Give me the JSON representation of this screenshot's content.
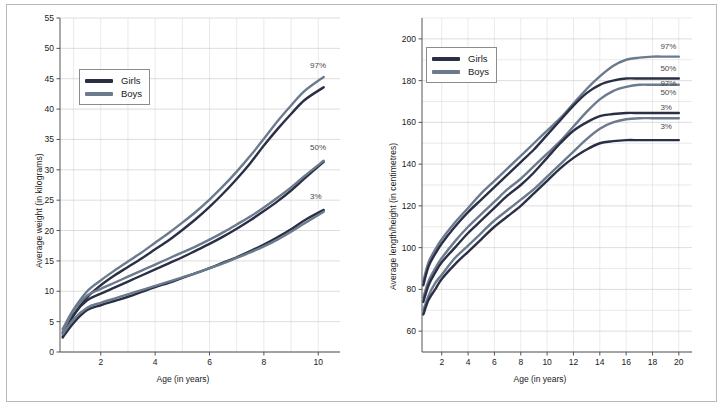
{
  "page": {
    "background": "#ffffff",
    "frame_color": "#b9b9b9"
  },
  "colors": {
    "girls": "#2a2f45",
    "boys": "#6b7a8c",
    "grid_minor": "#dcdcdc",
    "grid_major": "#cfcfcf",
    "axis": "#555555",
    "text": "#1a1a1a",
    "pct_text": "#4a4a4a"
  },
  "legend": {
    "girls_label": "Girls",
    "boys_label": "Boys"
  },
  "chart_data": [
    {
      "id": "weight-chart",
      "type": "line",
      "title": "",
      "xlabel": "Age (in years)",
      "ylabel": "Average weight (in kilograms)",
      "xlim": [
        0.5,
        10.8
      ],
      "ylim": [
        0,
        55
      ],
      "xticks": [
        2,
        4,
        6,
        8,
        10
      ],
      "xticklabels": [
        "2",
        "4",
        "6",
        "8",
        "10"
      ],
      "x_minor_step": 1,
      "yticks": [
        0,
        5,
        10,
        15,
        20,
        25,
        30,
        35,
        40,
        45,
        50,
        55
      ],
      "yticklabels": [
        "0",
        "5",
        "10",
        "15",
        "20",
        "25",
        "30",
        "35",
        "40",
        "45",
        "50",
        "55"
      ],
      "grid": true,
      "legend_position": "upper-left-inside",
      "annotations": [
        {
          "text": "97%",
          "x": 9.7,
          "y": 46.8
        },
        {
          "text": "50%",
          "x": 9.7,
          "y": 33.2
        },
        {
          "text": "3%",
          "x": 9.7,
          "y": 25.2
        }
      ],
      "x": [
        0.6,
        1,
        1.5,
        2,
        2.5,
        3,
        3.5,
        4,
        4.5,
        5,
        5.5,
        6,
        6.5,
        7,
        7.5,
        8,
        8.5,
        9,
        9.5,
        10.2
      ],
      "series": [
        {
          "name": "Girls 97%",
          "sex": "Girls",
          "percentile": "97%",
          "color": "#2a2f45",
          "values": [
            2.6,
            6.0,
            9.0,
            11.0,
            12.6,
            14.0,
            15.4,
            16.9,
            18.4,
            20.1,
            21.9,
            23.9,
            26.1,
            28.5,
            31.1,
            34.0,
            36.7,
            39.2,
            41.5,
            43.6
          ]
        },
        {
          "name": "Boys 97%",
          "sex": "Boys",
          "percentile": "97%",
          "color": "#6b7a8c",
          "values": [
            3.8,
            7.0,
            10.0,
            11.8,
            13.4,
            14.9,
            16.4,
            18.0,
            19.6,
            21.3,
            23.1,
            25.1,
            27.3,
            29.7,
            32.3,
            35.1,
            38.0,
            40.6,
            43.0,
            45.3
          ]
        },
        {
          "name": "Girls 50%",
          "sex": "Girls",
          "percentile": "50%",
          "color": "#2a2f45",
          "values": [
            3.1,
            6.2,
            8.5,
            9.6,
            10.6,
            11.6,
            12.6,
            13.6,
            14.6,
            15.6,
            16.7,
            17.8,
            19.0,
            20.3,
            21.7,
            23.2,
            24.8,
            26.6,
            28.6,
            31.3
          ]
        },
        {
          "name": "Boys 50%",
          "sex": "Boys",
          "percentile": "50%",
          "color": "#6b7a8c",
          "values": [
            3.4,
            6.8,
            9.3,
            10.4,
            11.4,
            12.4,
            13.4,
            14.4,
            15.4,
            16.4,
            17.4,
            18.5,
            19.7,
            21.0,
            22.3,
            23.8,
            25.4,
            27.1,
            29.0,
            31.5
          ]
        },
        {
          "name": "Girls 3%",
          "sex": "Girls",
          "percentile": "3%",
          "color": "#2a2f45",
          "values": [
            2.4,
            4.8,
            6.9,
            7.7,
            8.4,
            9.1,
            9.9,
            10.7,
            11.4,
            12.2,
            13.0,
            13.8,
            14.7,
            15.6,
            16.6,
            17.7,
            18.9,
            20.2,
            21.7,
            23.4
          ]
        },
        {
          "name": "Boys 3%",
          "sex": "Boys",
          "percentile": "3%",
          "color": "#6b7a8c",
          "values": [
            2.9,
            5.4,
            7.3,
            8.1,
            8.8,
            9.5,
            10.2,
            10.9,
            11.6,
            12.3,
            13.0,
            13.8,
            14.6,
            15.5,
            16.4,
            17.4,
            18.5,
            19.8,
            21.2,
            23.1
          ]
        }
      ]
    },
    {
      "id": "height-chart",
      "type": "line",
      "title": "",
      "xlabel": "Age (in years)",
      "ylabel": "Average length/height (in centimetres)",
      "xlim": [
        0.5,
        21
      ],
      "ylim": [
        50,
        210
      ],
      "xticks": [
        2,
        4,
        6,
        8,
        10,
        12,
        14,
        16,
        18,
        20
      ],
      "xticklabels": [
        "2",
        "4",
        "6",
        "8",
        "10",
        "12",
        "14",
        "16",
        "18",
        "20"
      ],
      "x_minor_step": 2,
      "yticks": [
        60,
        80,
        100,
        120,
        140,
        160,
        180,
        200
      ],
      "yticklabels": [
        "60",
        "80",
        "100",
        "120",
        "140",
        "160",
        "180",
        "200"
      ],
      "y_minor_step": 10,
      "grid": true,
      "legend_position": "upper-left-inside",
      "annotations": [
        {
          "text": "97%",
          "x": 18.6,
          "y": 195.0
        },
        {
          "text": "50%",
          "x": 18.6,
          "y": 184.5
        },
        {
          "text": "97%",
          "x": 18.6,
          "y": 177.5
        },
        {
          "text": "50%",
          "x": 18.6,
          "y": 173.0
        },
        {
          "text": "3%",
          "x": 18.6,
          "y": 166.0
        },
        {
          "text": "3%",
          "x": 18.6,
          "y": 157.0
        }
      ],
      "x": [
        0.6,
        1,
        1.5,
        2,
        3,
        4,
        5,
        6,
        7,
        8,
        9,
        10,
        11,
        12,
        13,
        14,
        15,
        16,
        17,
        18,
        19,
        20
      ],
      "series": [
        {
          "name": "Boys 97%",
          "sex": "Boys",
          "percentile": "97%",
          "color": "#6b7a8c",
          "values": [
            84,
            93,
            99,
            104,
            112,
            119,
            126,
            132,
            138,
            144,
            150,
            156,
            162,
            169,
            176,
            182,
            187,
            190,
            191,
            191.5,
            191.5,
            191.5
          ]
        },
        {
          "name": "Girls 97%",
          "sex": "Girls",
          "percentile": "97%",
          "color": "#2a2f45",
          "values": [
            82,
            91,
            97,
            102,
            110,
            117,
            123,
            129,
            135,
            141,
            147,
            154,
            161,
            168,
            174,
            178,
            180,
            181,
            181,
            181,
            181,
            181
          ]
        },
        {
          "name": "Boys 50%",
          "sex": "Boys",
          "percentile": "50%",
          "color": "#6b7a8c",
          "values": [
            76,
            84,
            90,
            95,
            103,
            110,
            116,
            122,
            128,
            133,
            139,
            145,
            151,
            158,
            165,
            171,
            175,
            177,
            178,
            178,
            178,
            178
          ]
        },
        {
          "name": "Girls 50%",
          "sex": "Girls",
          "percentile": "50%",
          "color": "#2a2f45",
          "values": [
            74,
            82,
            88,
            93,
            100,
            107,
            113,
            119,
            125,
            130,
            136,
            143,
            150,
            156,
            160,
            163,
            164,
            164.5,
            164.5,
            164.5,
            164.5,
            164.5
          ]
        },
        {
          "name": "Boys 3%",
          "sex": "Boys",
          "percentile": "3%",
          "color": "#6b7a8c",
          "values": [
            70,
            77,
            83,
            87,
            95,
            101,
            107,
            113,
            118,
            123,
            128,
            134,
            140,
            146,
            152,
            157,
            160,
            161.5,
            162,
            162,
            162,
            162
          ]
        },
        {
          "name": "Girls 3%",
          "sex": "Girls",
          "percentile": "3%",
          "color": "#2a2f45",
          "values": [
            68,
            75,
            80,
            85,
            92,
            98,
            104,
            110,
            115,
            120,
            126,
            132,
            138,
            143,
            147,
            150,
            151,
            151.5,
            151.5,
            151.5,
            151.5,
            151.5
          ]
        }
      ]
    }
  ]
}
